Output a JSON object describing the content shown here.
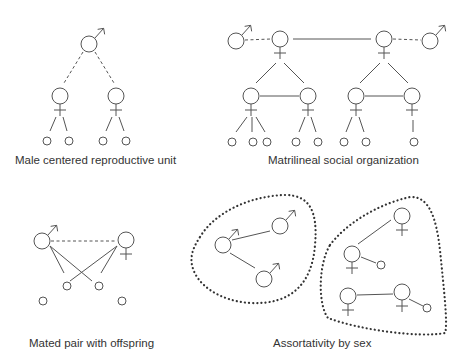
{
  "figure": {
    "panels": [
      {
        "id": "male-centered",
        "caption": "Male centered reproductive unit",
        "nodes": [
          {
            "sex": "male",
            "x": 89,
            "y": 44,
            "r": 8
          },
          {
            "sex": "female",
            "x": 60,
            "y": 96,
            "r": 8
          },
          {
            "sex": "female",
            "x": 116,
            "y": 96,
            "r": 8
          },
          {
            "sex": "offspring",
            "x": 47,
            "y": 141,
            "r": 4
          },
          {
            "sex": "offspring",
            "x": 69,
            "y": 141,
            "r": 4
          },
          {
            "sex": "offspring",
            "x": 103,
            "y": 141,
            "r": 4
          },
          {
            "sex": "offspring",
            "x": 126,
            "y": 141,
            "r": 4
          }
        ],
        "links": [
          {
            "type": "dashed",
            "x1": 83,
            "y1": 52,
            "x2": 64,
            "y2": 83
          },
          {
            "type": "dashed",
            "x1": 95,
            "y1": 52,
            "x2": 114,
            "y2": 83
          },
          {
            "type": "solid",
            "x1": 56,
            "y1": 117,
            "x2": 50,
            "y2": 131
          },
          {
            "type": "solid",
            "x1": 63,
            "y1": 117,
            "x2": 67,
            "y2": 131
          },
          {
            "type": "solid",
            "x1": 112,
            "y1": 117,
            "x2": 106,
            "y2": 131
          },
          {
            "type": "solid",
            "x1": 119,
            "y1": 117,
            "x2": 124,
            "y2": 131
          }
        ]
      },
      {
        "id": "matrilineal",
        "caption": "Matrilineal social organization",
        "nodes": [
          {
            "sex": "male",
            "x": 236,
            "y": 41,
            "r": 8
          },
          {
            "sex": "female",
            "x": 280,
            "y": 39,
            "r": 8
          },
          {
            "sex": "female",
            "x": 384,
            "y": 39,
            "r": 8
          },
          {
            "sex": "male",
            "x": 430,
            "y": 41,
            "r": 8
          },
          {
            "sex": "female",
            "x": 251,
            "y": 96,
            "r": 8
          },
          {
            "sex": "female",
            "x": 308,
            "y": 96,
            "r": 8
          },
          {
            "sex": "female",
            "x": 356,
            "y": 96,
            "r": 8
          },
          {
            "sex": "female",
            "x": 412,
            "y": 96,
            "r": 8
          },
          {
            "sex": "offspring",
            "x": 232,
            "y": 142,
            "r": 4
          },
          {
            "sex": "offspring",
            "x": 253,
            "y": 142,
            "r": 4
          },
          {
            "sex": "offspring",
            "x": 267,
            "y": 142,
            "r": 4
          },
          {
            "sex": "offspring",
            "x": 296,
            "y": 142,
            "r": 4
          },
          {
            "sex": "offspring",
            "x": 318,
            "y": 142,
            "r": 4
          },
          {
            "sex": "offspring",
            "x": 344,
            "y": 142,
            "r": 4
          },
          {
            "sex": "offspring",
            "x": 366,
            "y": 142,
            "r": 4
          },
          {
            "sex": "offspring",
            "x": 414,
            "y": 142,
            "r": 4
          }
        ],
        "links": [
          {
            "type": "dashed",
            "x1": 245,
            "y1": 40,
            "x2": 271,
            "y2": 39
          },
          {
            "type": "solid",
            "x1": 293,
            "y1": 39,
            "x2": 371,
            "y2": 39
          },
          {
            "type": "dashed",
            "x1": 393,
            "y1": 39,
            "x2": 421,
            "y2": 40
          },
          {
            "type": "solid",
            "x1": 276,
            "y1": 63,
            "x2": 256,
            "y2": 83
          },
          {
            "type": "solid",
            "x1": 284,
            "y1": 63,
            "x2": 304,
            "y2": 83
          },
          {
            "type": "solid",
            "x1": 380,
            "y1": 63,
            "x2": 360,
            "y2": 83
          },
          {
            "type": "solid",
            "x1": 388,
            "y1": 63,
            "x2": 408,
            "y2": 83
          },
          {
            "type": "solid",
            "x1": 260,
            "y1": 96,
            "x2": 299,
            "y2": 96
          },
          {
            "type": "solid",
            "x1": 365,
            "y1": 96,
            "x2": 403,
            "y2": 96
          },
          {
            "type": "solid",
            "x1": 247,
            "y1": 117,
            "x2": 236,
            "y2": 132
          },
          {
            "type": "solid",
            "x1": 252,
            "y1": 117,
            "x2": 252,
            "y2": 132
          },
          {
            "type": "solid",
            "x1": 256,
            "y1": 117,
            "x2": 265,
            "y2": 132
          },
          {
            "type": "solid",
            "x1": 305,
            "y1": 117,
            "x2": 299,
            "y2": 132
          },
          {
            "type": "solid",
            "x1": 311,
            "y1": 117,
            "x2": 316,
            "y2": 132
          },
          {
            "type": "solid",
            "x1": 352,
            "y1": 117,
            "x2": 346,
            "y2": 132
          },
          {
            "type": "solid",
            "x1": 359,
            "y1": 117,
            "x2": 364,
            "y2": 132
          },
          {
            "type": "solid",
            "x1": 413,
            "y1": 120,
            "x2": 413,
            "y2": 132
          }
        ]
      },
      {
        "id": "mated-pair",
        "caption": "Mated pair with offspring",
        "nodes": [
          {
            "sex": "male",
            "x": 42,
            "y": 241,
            "r": 8
          },
          {
            "sex": "female",
            "x": 126,
            "y": 240,
            "r": 8
          },
          {
            "sex": "offspring",
            "x": 67,
            "y": 286,
            "r": 4
          },
          {
            "sex": "offspring",
            "x": 99,
            "y": 286,
            "r": 4
          },
          {
            "sex": "offspring",
            "x": 43,
            "y": 301,
            "r": 4
          },
          {
            "sex": "offspring",
            "x": 122,
            "y": 301,
            "r": 4
          }
        ],
        "links": [
          {
            "type": "dashed",
            "x1": 51,
            "y1": 241,
            "x2": 117,
            "y2": 241
          },
          {
            "type": "solid",
            "x1": 50,
            "y1": 246,
            "x2": 64,
            "y2": 273
          },
          {
            "type": "solid",
            "x1": 50,
            "y1": 246,
            "x2": 92,
            "y2": 281
          },
          {
            "type": "solid",
            "x1": 117,
            "y1": 246,
            "x2": 70,
            "y2": 281
          },
          {
            "type": "solid",
            "x1": 117,
            "y1": 246,
            "x2": 101,
            "y2": 273
          }
        ]
      },
      {
        "id": "assortativity",
        "caption": "Assortativity by sex",
        "groups": [
          {
            "boundary": "M 200 237 C 215 212, 250 196, 285 195 C 310 195, 318 212, 315 245 C 312 285, 290 305, 250 303 C 220 301, 196 285, 192 265 C 190 255, 194 246, 200 237 Z"
          },
          {
            "boundary": "M 330 245 C 345 225, 375 205, 410 197 C 428 196, 436 215, 440 250 C 444 290, 448 325, 445 333 C 420 338, 360 330, 328 318 C 318 305, 318 265, 330 245 Z"
          }
        ],
        "nodes": [
          {
            "sex": "male",
            "x": 223,
            "y": 245,
            "r": 8
          },
          {
            "sex": "male",
            "x": 280,
            "y": 226,
            "r": 8
          },
          {
            "sex": "male",
            "x": 264,
            "y": 279,
            "r": 8
          },
          {
            "sex": "female",
            "x": 402,
            "y": 216,
            "r": 8
          },
          {
            "sex": "female",
            "x": 352,
            "y": 254,
            "r": 8
          },
          {
            "sex": "offspring",
            "x": 381,
            "y": 265,
            "r": 4
          },
          {
            "sex": "female",
            "x": 348,
            "y": 296,
            "r": 8
          },
          {
            "sex": "female",
            "x": 402,
            "y": 292,
            "r": 8
          },
          {
            "sex": "offspring",
            "x": 427,
            "y": 308,
            "r": 4
          }
        ],
        "links": [
          {
            "type": "solid",
            "x1": 232,
            "y1": 240,
            "x2": 270,
            "y2": 231
          },
          {
            "type": "solid",
            "x1": 230,
            "y1": 253,
            "x2": 255,
            "y2": 268
          },
          {
            "type": "solid",
            "x1": 358,
            "y1": 244,
            "x2": 391,
            "y2": 220
          },
          {
            "type": "solid",
            "x1": 361,
            "y1": 257,
            "x2": 376,
            "y2": 263
          },
          {
            "type": "solid",
            "x1": 357,
            "y1": 295,
            "x2": 393,
            "y2": 294
          },
          {
            "type": "solid",
            "x1": 409,
            "y1": 299,
            "x2": 423,
            "y2": 306
          }
        ]
      }
    ],
    "captions": {
      "c1": "Male centered reproductive unit",
      "c2": "Matrilineal social organization",
      "c3": "Mated pair with offspring",
      "c4": "Assortativity by sex"
    },
    "colors": {
      "stroke": "#555555",
      "dots": "#333333",
      "text": "#333333",
      "background": "#ffffff"
    }
  }
}
